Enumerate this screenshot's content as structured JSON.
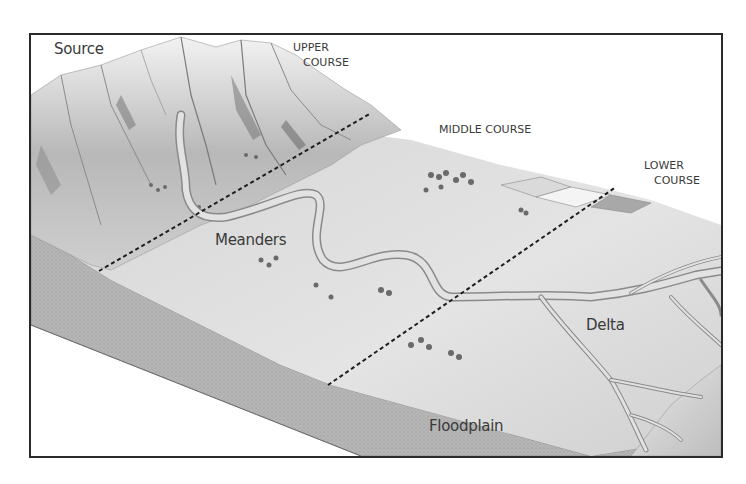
{
  "diagram": {
    "labels": {
      "source": "Source",
      "upper_course_line1": "UPPER",
      "upper_course_line2": "COURSE",
      "middle_course": "MIDDLE COURSE",
      "lower_course_line1": "LOWER",
      "lower_course_line2": "COURSE",
      "meanders": "Meanders",
      "floodplain": "Floodplain",
      "delta": "Delta"
    },
    "sections": [
      {
        "name": "Upper course",
        "features": [
          "Source"
        ]
      },
      {
        "name": "Middle course",
        "features": [
          "Meanders"
        ]
      },
      {
        "name": "Lower course",
        "features": [
          "Floodplain",
          "Delta"
        ]
      }
    ],
    "dividers": [
      {
        "name": "upper-middle boundary",
        "style": "dashed"
      },
      {
        "name": "middle-lower boundary",
        "style": "dashed"
      }
    ],
    "colors": {
      "frame": "#2a2a2a",
      "terrain_light": "#e6e6e6",
      "terrain_mid": "#c4c4c4",
      "terrain_dark": "#7a7a7a",
      "river": "#d8d8d8",
      "river_edge": "#8a8a8a",
      "cross_section": "#b0b0b0",
      "label_text": "#3a3a3a"
    }
  }
}
